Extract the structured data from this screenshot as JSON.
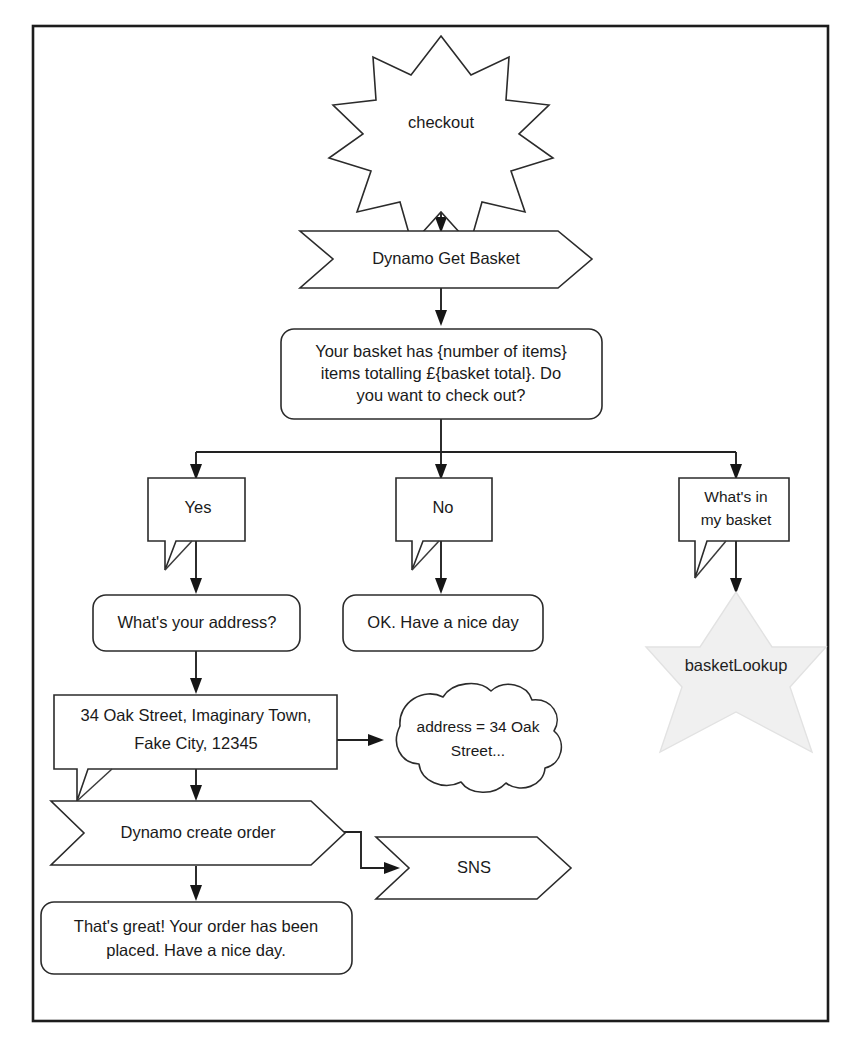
{
  "diagram": {
    "frame": {
      "border_color": "#1c1c1c"
    },
    "nodes": {
      "checkout": {
        "label": "checkout",
        "shape": "star-burst"
      },
      "dynamo_get_basket": {
        "label": "Dynamo Get Basket",
        "shape": "chevron"
      },
      "basket_prompt": {
        "label": "Your basket has {number of items} items totalling £{basket total}. Do you want to check out?",
        "shape": "rounded-rect",
        "lines": [
          "Your basket has {number of items}",
          "items totalling £{basket total}. Do",
          "you want to check out?"
        ]
      },
      "yes": {
        "label": "Yes",
        "shape": "speech-bubble"
      },
      "no": {
        "label": "No",
        "shape": "speech-bubble"
      },
      "whats_in_my_basket": {
        "label": "What's in my basket",
        "shape": "speech-bubble",
        "lines": [
          "What's in",
          "my basket"
        ]
      },
      "whats_your_address": {
        "label": "What's your address?",
        "shape": "rounded-rect"
      },
      "ok_have_nice_day": {
        "label": "OK. Have a nice day",
        "shape": "rounded-rect"
      },
      "basket_lookup": {
        "label": "basketLookup",
        "shape": "star-6",
        "fill": "#f0f0f0"
      },
      "address_answer": {
        "label": "34 Oak Street, Imaginary Town, Fake City, 12345",
        "shape": "speech-bubble",
        "lines": [
          "34 Oak Street, Imaginary Town,",
          "Fake City, 12345"
        ]
      },
      "address_variable": {
        "label": "address = 34 Oak Street...",
        "shape": "cloud",
        "lines": [
          "address = 34 Oak",
          "Street..."
        ]
      },
      "dynamo_create_order": {
        "label": "Dynamo create order",
        "shape": "chevron"
      },
      "sns": {
        "label": "SNS",
        "shape": "chevron"
      },
      "order_placed": {
        "label": "That's great! Your order has been placed. Have a nice day.",
        "shape": "rounded-rect",
        "lines": [
          "That's great! Your order has been",
          "placed. Have a nice day."
        ]
      }
    },
    "edges": [
      {
        "from": "checkout",
        "to": "dynamo_get_basket"
      },
      {
        "from": "dynamo_get_basket",
        "to": "basket_prompt"
      },
      {
        "from": "basket_prompt",
        "to": "yes"
      },
      {
        "from": "basket_prompt",
        "to": "no"
      },
      {
        "from": "basket_prompt",
        "to": "whats_in_my_basket"
      },
      {
        "from": "yes",
        "to": "whats_your_address"
      },
      {
        "from": "no",
        "to": "ok_have_nice_day"
      },
      {
        "from": "whats_in_my_basket",
        "to": "basket_lookup"
      },
      {
        "from": "whats_your_address",
        "to": "address_answer"
      },
      {
        "from": "address_answer",
        "to": "address_variable"
      },
      {
        "from": "address_answer",
        "to": "dynamo_create_order"
      },
      {
        "from": "dynamo_create_order",
        "to": "sns"
      },
      {
        "from": "dynamo_create_order",
        "to": "order_placed"
      }
    ]
  }
}
